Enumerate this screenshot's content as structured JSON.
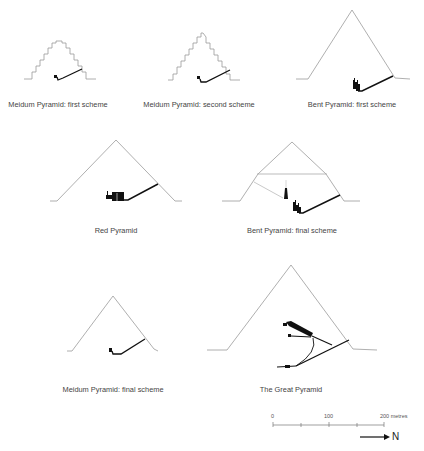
{
  "figure": {
    "panels": [
      {
        "id": "meidum-first",
        "label": "Meidum Pyramid: first scheme"
      },
      {
        "id": "meidum-second",
        "label": "Meidum Pyramid: second scheme"
      },
      {
        "id": "bent-first",
        "label": "Bent Pyramid: first scheme"
      },
      {
        "id": "red",
        "label": "Red Pyramid"
      },
      {
        "id": "bent-final",
        "label": "Bent Pyramid: final scheme"
      },
      {
        "id": "meidum-final",
        "label": "Meidum Pyramid: final scheme"
      },
      {
        "id": "great",
        "label": "The Great Pyramid"
      }
    ],
    "scale_bar": {
      "ticks": [
        "0",
        "100",
        "200 metres"
      ],
      "north_label": "N"
    },
    "colors": {
      "outline": "#9a9a9a",
      "passage": "#111111",
      "text": "#444444"
    }
  }
}
